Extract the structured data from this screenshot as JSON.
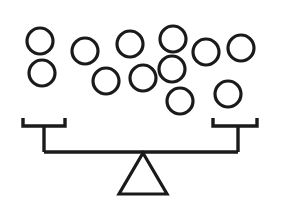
{
  "figure": {
    "name": "balance-scale-with-balls",
    "canvas": {
      "width": 282,
      "height": 210
    },
    "colors": {
      "background": "#ffffff",
      "stroke": "#1a1a1a",
      "fill": "none"
    },
    "stroke_widths": {
      "ball": 3.2,
      "beam": 3.4,
      "fulcrum": 3.2
    },
    "counts": {
      "balls_total": 13,
      "balls_upper_row": 7,
      "balls_lower_row": 6
    }
  },
  "balls": [
    {
      "id": "ball-1",
      "cx": 40,
      "cy": 41,
      "r": 13,
      "row": "upper"
    },
    {
      "id": "ball-2",
      "cx": 85,
      "cy": 51,
      "r": 13,
      "row": "upper"
    },
    {
      "id": "ball-3",
      "cx": 130,
      "cy": 44,
      "r": 13,
      "row": "upper"
    },
    {
      "id": "ball-4",
      "cx": 173,
      "cy": 39,
      "r": 13,
      "row": "upper"
    },
    {
      "id": "ball-5",
      "cx": 206,
      "cy": 52,
      "r": 13,
      "row": "upper"
    },
    {
      "id": "ball-6",
      "cx": 241,
      "cy": 48,
      "r": 13,
      "row": "upper"
    },
    {
      "id": "ball-7",
      "cx": 42,
      "cy": 73,
      "r": 13,
      "row": "lower"
    },
    {
      "id": "ball-8",
      "cx": 106,
      "cy": 81,
      "r": 13,
      "row": "lower"
    },
    {
      "id": "ball-9",
      "cx": 143,
      "cy": 78,
      "r": 13,
      "row": "lower"
    },
    {
      "id": "ball-10",
      "cx": 172,
      "cy": 69,
      "r": 13,
      "row": "upper"
    },
    {
      "id": "ball-11",
      "cx": 180,
      "cy": 101,
      "r": 13,
      "row": "lower"
    },
    {
      "id": "ball-12",
      "cx": 228,
      "cy": 94,
      "r": 13,
      "row": "lower"
    },
    {
      "id": "ball-13",
      "cx": 63,
      "cy": 44,
      "r": 0,
      "row": "hidden"
    }
  ],
  "balance": {
    "beam": {
      "name": "beam",
      "y": 152,
      "x_left": 44,
      "x_right": 238
    },
    "left_pan": {
      "name": "left-pan-hanger",
      "bar_y": 126,
      "bar_x_left": 23,
      "bar_x_right": 65,
      "tip_top_y": 118,
      "drop_x": 44
    },
    "right_pan": {
      "name": "right-pan-hanger",
      "bar_y": 126,
      "bar_x_left": 213,
      "bar_x_right": 257,
      "tip_top_y": 118,
      "drop_x": 238
    },
    "fulcrum": {
      "name": "fulcrum-triangle",
      "apex_x": 143,
      "apex_y": 153,
      "base_y": 194,
      "base_x_left": 119,
      "base_x_right": 167
    }
  }
}
